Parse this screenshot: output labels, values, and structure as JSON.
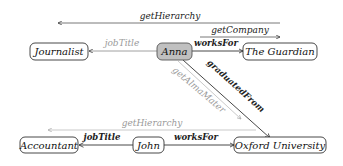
{
  "diagram": {
    "nodes": [
      {
        "id": "journalist",
        "label": "Journalist"
      },
      {
        "id": "anna",
        "label": "Anna",
        "highlighted": true,
        "fill": "#c0c0c0"
      },
      {
        "id": "the_guardian",
        "label": "The Guardian"
      },
      {
        "id": "accountant",
        "label": "Accountant"
      },
      {
        "id": "john",
        "label": "John"
      },
      {
        "id": "oxford_university",
        "label": "Oxford University"
      }
    ],
    "edges": [
      {
        "id": "get_hierarchy_top",
        "label": "getHierarchy",
        "from": "the_guardian",
        "to": "journalist",
        "style": "derived"
      },
      {
        "id": "get_company",
        "label": "getCompany",
        "from": "anna",
        "to": "the_guardian",
        "style": "derived"
      },
      {
        "id": "anna_job_title",
        "label": "jobTitle",
        "from": "anna",
        "to": "journalist",
        "style": "gray"
      },
      {
        "id": "anna_works_for",
        "label": "worksFor",
        "from": "anna",
        "to": "the_guardian",
        "style": "solid"
      },
      {
        "id": "graduated_from",
        "label": "graduatedFrom",
        "from": "anna",
        "to": "oxford_university",
        "style": "solid"
      },
      {
        "id": "get_alma_mater",
        "label": "getAlmaMater",
        "from": "anna",
        "to": "oxford_university",
        "style": "gray"
      },
      {
        "id": "get_hierarchy_bottom",
        "label": "getHierarchy",
        "from": "oxford_university",
        "to": "accountant",
        "style": "gray"
      },
      {
        "id": "john_job_title",
        "label": "jobTitle",
        "from": "john",
        "to": "accountant",
        "style": "solid"
      },
      {
        "id": "john_works_for",
        "label": "worksFor",
        "from": "john",
        "to": "oxford_university",
        "style": "solid"
      }
    ],
    "colors": {
      "edge": "#333333",
      "edge_gray": "#aaaaaa",
      "node_border": "#333333",
      "highlight_fill": "#c0c0c0"
    }
  }
}
